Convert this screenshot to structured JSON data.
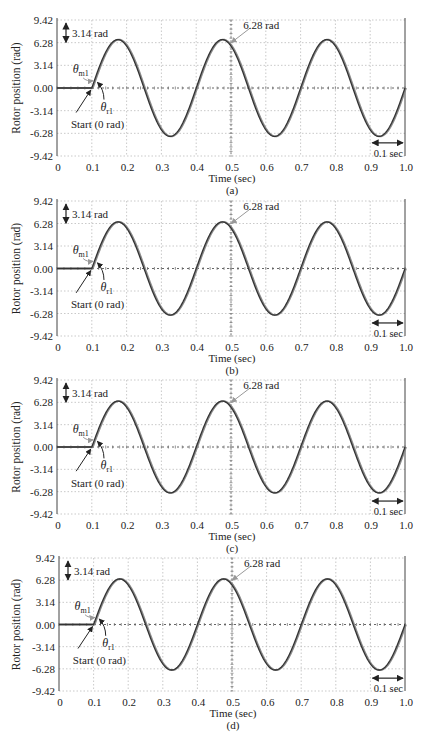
{
  "figure": {
    "panels": [
      {
        "id": "a",
        "caption": "(a)",
        "top": 20,
        "bottom": 156,
        "left": 57,
        "right": 405,
        "amp": 6.7
      },
      {
        "id": "b",
        "caption": "(b)",
        "top": 201,
        "bottom": 336,
        "left": 57,
        "right": 405,
        "amp": 6.5
      },
      {
        "id": "c",
        "caption": "(c)",
        "top": 380,
        "bottom": 514,
        "left": 57,
        "right": 405,
        "amp": 6.45
      },
      {
        "id": "d",
        "caption": "(d)",
        "top": 558,
        "bottom": 691,
        "left": 59,
        "right": 405,
        "amp": 6.45
      }
    ],
    "labels": {
      "ylabel": "Rotor position  (rad)",
      "xlabel": "Time (sec)",
      "amp_marker": "3.14 rad",
      "peak_marker": "6.28 rad",
      "period_marker": "0.1 sec",
      "start_marker": "Start (0 rad)",
      "theta_m": "θ",
      "theta_m_sub": "m1",
      "theta_r": "θ",
      "theta_r_sub": "r1"
    },
    "colors": {
      "curve_rotor": "#333333",
      "curve_motor": "#8a8a8a",
      "grid": "#bbbbbb",
      "axis": "#444444",
      "arrow_gray": "#999999"
    }
  },
  "chart_data": [
    {
      "type": "line",
      "title": "(a)",
      "xlabel": "Time (sec)",
      "ylabel": "Rotor position (rad)",
      "xlim": [
        0,
        1.0
      ],
      "ylim": [
        -9.42,
        9.42
      ],
      "xticks": [
        "0",
        "0.1",
        "0.2",
        "0.3",
        "0.4",
        "0.5",
        "0.6",
        "0.7",
        "0.8",
        "0.9",
        "1.0"
      ],
      "yticks": [
        "9.42",
        "6.28",
        "3.14",
        "0.00",
        "-3.14",
        "-6.28",
        "-9.42"
      ],
      "grid": true,
      "annotations": [
        "3.14 rad",
        "6.28 rad",
        "0.1 sec",
        "Start (0 rad)",
        "θm1",
        "θr1"
      ],
      "series": [
        {
          "name": "θm1",
          "x": [
            0,
            0.1,
            0.175,
            0.25,
            0.325,
            0.4,
            0.475,
            0.55,
            0.625,
            0.7,
            0.775,
            0.85,
            0.925,
            1.0
          ],
          "values": [
            0,
            0,
            6.7,
            0,
            -6.7,
            0,
            6.7,
            0,
            -6.7,
            0,
            6.7,
            0,
            -6.7,
            0
          ]
        },
        {
          "name": "θr1",
          "x": [
            0,
            0.1,
            0.175,
            0.25,
            0.325,
            0.4,
            0.475,
            0.55,
            0.625,
            0.7,
            0.775,
            0.85,
            0.925,
            1.0
          ],
          "values": [
            0,
            0,
            6.7,
            0,
            -6.7,
            0,
            6.7,
            0,
            -6.7,
            0,
            6.7,
            0,
            -6.7,
            0
          ]
        }
      ]
    },
    {
      "type": "line",
      "title": "(b)",
      "xlabel": "Time (sec)",
      "ylabel": "Rotor position (rad)",
      "xlim": [
        0,
        1.0
      ],
      "ylim": [
        -9.42,
        9.42
      ],
      "xticks": [
        "0",
        "0.1",
        "0.2",
        "0.3",
        "0.4",
        "0.5",
        "0.6",
        "0.7",
        "0.8",
        "0.9",
        "1.0"
      ],
      "yticks": [
        "9.42",
        "6.28",
        "3.14",
        "0.00",
        "-3.14",
        "-6.28",
        "-9.42"
      ],
      "grid": true,
      "annotations": [
        "3.14 rad",
        "6.28 rad",
        "0.1 sec",
        "Start (0 rad)",
        "θm1",
        "θr1"
      ],
      "series": [
        {
          "name": "θm1",
          "x": [
            0,
            0.1,
            0.175,
            0.25,
            0.325,
            0.4,
            0.475,
            0.55,
            0.625,
            0.7,
            0.775,
            0.85,
            0.925,
            1.0
          ],
          "values": [
            0,
            0,
            6.5,
            0,
            -6.5,
            0,
            6.5,
            0,
            -6.5,
            0,
            6.5,
            0,
            -6.5,
            0
          ]
        },
        {
          "name": "θr1",
          "x": [
            0,
            0.1,
            0.175,
            0.25,
            0.325,
            0.4,
            0.475,
            0.55,
            0.625,
            0.7,
            0.775,
            0.85,
            0.925,
            1.0
          ],
          "values": [
            0,
            0,
            6.5,
            0,
            -6.5,
            0,
            6.5,
            0,
            -6.5,
            0,
            6.5,
            0,
            -6.5,
            0
          ]
        }
      ]
    },
    {
      "type": "line",
      "title": "(c)",
      "xlabel": "Time (sec)",
      "ylabel": "Rotor position (rad)",
      "xlim": [
        0,
        1.0
      ],
      "ylim": [
        -9.42,
        9.42
      ],
      "xticks": [
        "0",
        "0.1",
        "0.2",
        "0.3",
        "0.4",
        "0.5",
        "0.6",
        "0.7",
        "0.8",
        "0.9",
        "1.0"
      ],
      "yticks": [
        "9.42",
        "6.28",
        "3.14",
        "0.00",
        "-3.14",
        "-6.28",
        "-9.42"
      ],
      "grid": true,
      "annotations": [
        "3.14 rad",
        "6.28 rad",
        "0.1 sec",
        "Start (0 rad)",
        "θm1",
        "θr1"
      ],
      "series": [
        {
          "name": "θm1",
          "x": [
            0,
            0.1,
            0.175,
            0.25,
            0.325,
            0.4,
            0.475,
            0.55,
            0.625,
            0.7,
            0.775,
            0.85,
            0.925,
            1.0
          ],
          "values": [
            0,
            0,
            6.45,
            0,
            -6.45,
            0,
            6.45,
            0,
            -6.45,
            0,
            6.45,
            0,
            -6.45,
            0
          ]
        },
        {
          "name": "θr1",
          "x": [
            0,
            0.1,
            0.175,
            0.25,
            0.325,
            0.4,
            0.475,
            0.55,
            0.625,
            0.7,
            0.775,
            0.85,
            0.925,
            1.0
          ],
          "values": [
            0,
            0,
            6.45,
            0,
            -6.45,
            0,
            6.45,
            0,
            -6.45,
            0,
            6.45,
            0,
            -6.45,
            0
          ]
        }
      ]
    },
    {
      "type": "line",
      "title": "(d)",
      "xlabel": "Time (sec)",
      "ylabel": "Rotor position (rad)",
      "xlim": [
        0,
        1.0
      ],
      "ylim": [
        -9.42,
        9.42
      ],
      "xticks": [
        "0",
        "0.1",
        "0.2",
        "0.3",
        "0.4",
        "0.5",
        "0.6",
        "0.7",
        "0.8",
        "0.9",
        "1.0"
      ],
      "yticks": [
        "9.42",
        "6.28",
        "3.14",
        "0.00",
        "-3.14",
        "-6.28",
        "-9.42"
      ],
      "grid": true,
      "annotations": [
        "3.14 rad",
        "6.28 rad",
        "0.1 sec",
        "Start (0 rad)",
        "θm1",
        "θr1"
      ],
      "series": [
        {
          "name": "θm1",
          "x": [
            0,
            0.1,
            0.175,
            0.25,
            0.325,
            0.4,
            0.475,
            0.55,
            0.625,
            0.7,
            0.775,
            0.85,
            0.925,
            1.0
          ],
          "values": [
            0,
            0,
            6.45,
            0,
            -6.45,
            0,
            6.45,
            0,
            -6.45,
            0,
            6.45,
            0,
            -6.45,
            0
          ]
        },
        {
          "name": "θr1",
          "x": [
            0,
            0.1,
            0.175,
            0.25,
            0.325,
            0.4,
            0.475,
            0.55,
            0.625,
            0.7,
            0.775,
            0.85,
            0.925,
            1.0
          ],
          "values": [
            0,
            0,
            6.45,
            0,
            -6.45,
            0,
            6.45,
            0,
            -6.45,
            0,
            6.45,
            0,
            -6.45,
            0
          ]
        }
      ]
    }
  ]
}
